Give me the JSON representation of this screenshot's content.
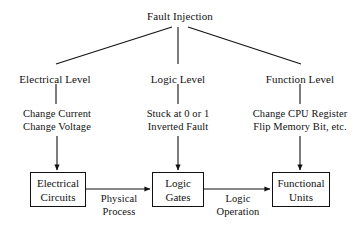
{
  "diagram": {
    "title": "Fault Injection",
    "root": {
      "label": "Fault Injection",
      "x": 180,
      "y": 10
    },
    "levels": [
      {
        "label": "Electrical Level",
        "x": 55,
        "y": 73
      },
      {
        "label": "Logic Level",
        "x": 178,
        "y": 73
      },
      {
        "label": "Function Level",
        "x": 300,
        "y": 73
      }
    ],
    "methods": [
      {
        "line1": "Change Current",
        "line2": "Change Voltage",
        "x": 57,
        "y": 107
      },
      {
        "line1": "Stuck at 0 or 1",
        "line2": "Inverted Fault",
        "x": 178,
        "y": 107
      },
      {
        "line1": "Change CPU Register",
        "line2": "Flip Memory Bit, etc.",
        "x": 300,
        "y": 107
      }
    ],
    "boxes": [
      {
        "line1": "Electrical",
        "line2": "Circuits",
        "x": 30,
        "y": 172,
        "w": 56,
        "h": 35
      },
      {
        "line1": "Logic",
        "line2": "Gates",
        "x": 152,
        "y": 172,
        "w": 52,
        "h": 35
      },
      {
        "line1": "Functional",
        "line2": "Units",
        "x": 272,
        "y": 172,
        "w": 58,
        "h": 35
      }
    ],
    "edge_labels": [
      {
        "line1": "Physical",
        "line2": "Process",
        "x": 119,
        "y": 192
      },
      {
        "line1": "Logic",
        "line2": "Operation",
        "x": 238,
        "y": 192
      }
    ],
    "colors": {
      "stroke": "#111111",
      "background": "#ffffff",
      "text": "#111111"
    }
  }
}
